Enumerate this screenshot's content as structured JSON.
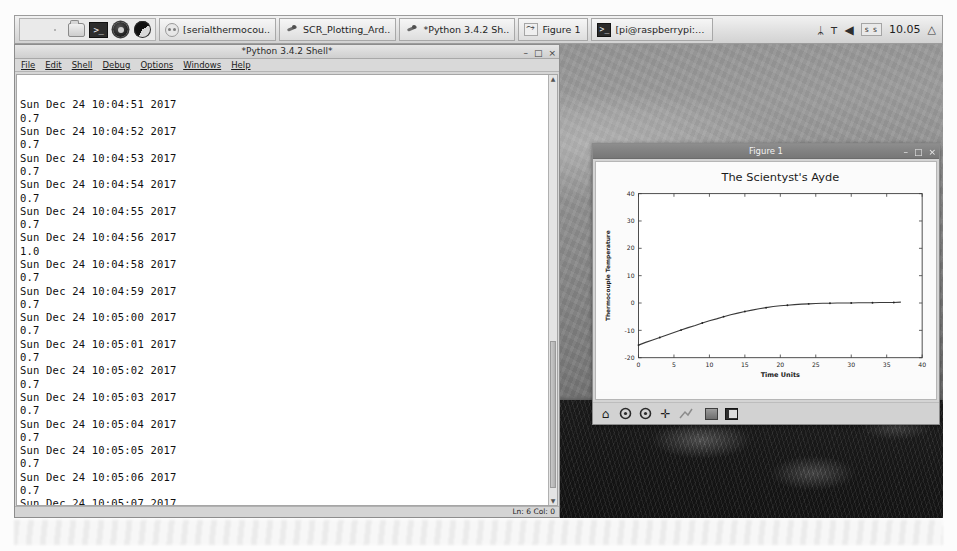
{
  "taskbar": {
    "launchers": [
      {
        "name": "raspberry-menu-icon",
        "label": ""
      },
      {
        "name": "web-browser-icon",
        "label": ""
      },
      {
        "name": "file-manager-icon",
        "label": ""
      },
      {
        "name": "terminal-icon",
        "label": ">_"
      },
      {
        "name": "mathematica-icon",
        "label": ""
      },
      {
        "name": "wolfram-icon",
        "label": ""
      }
    ],
    "windows": [
      {
        "label": "[serialthermocou..",
        "icon": "serial-monitor-icon",
        "active": false
      },
      {
        "label": "SCR_Plotting_Ard..",
        "icon": "python-file-icon",
        "active": false
      },
      {
        "label": "*Python 3.4.2 Sh..",
        "icon": "python-file-icon",
        "active": false
      },
      {
        "label": "Figure 1",
        "icon": "figure-window-icon",
        "active": false
      },
      {
        "label": "[pi@raspberrypi: ~]",
        "icon": "terminal-window-icon",
        "active": false
      }
    ],
    "tray": {
      "bluetooth": "ᛦ",
      "wifi": "ᴛ",
      "volume": "◀",
      "keyboard_layout": "s s",
      "clock": "10.05",
      "eject": "△"
    }
  },
  "idle_window": {
    "title": "*Python 3.4.2 Shell*",
    "menu": [
      "File",
      "Edit",
      "Shell",
      "Debug",
      "Options",
      "Windows",
      "Help"
    ],
    "controls": {
      "minimize": "–",
      "maximize": "□",
      "close": "×"
    },
    "status": "Ln: 6 Col: 0",
    "output": "Sun Dec 24 10:04:51 2017\n0.7\nSun Dec 24 10:04:52 2017\n0.7\nSun Dec 24 10:04:53 2017\n0.7\nSun Dec 24 10:04:54 2017\n0.7\nSun Dec 24 10:04:55 2017\n0.7\nSun Dec 24 10:04:56 2017\n1.0\nSun Dec 24 10:04:58 2017\n0.7\nSun Dec 24 10:04:59 2017\n0.7\nSun Dec 24 10:05:00 2017\n0.7\nSun Dec 24 10:05:01 2017\n0.7\nSun Dec 24 10:05:02 2017\n0.7\nSun Dec 24 10:05:03 2017\n0.7\nSun Dec 24 10:05:04 2017\n0.7\nSun Dec 24 10:05:05 2017\n0.7\nSun Dec 24 10:05:06 2017\n0.7\nSun Dec 24 10:05:07 2017\n0.7\nSun Dec 24 10:05:08 2017\n0.7"
  },
  "figure_window": {
    "title": "Figure 1",
    "controls": {
      "minimize": "–",
      "maximize": "□",
      "close": "×"
    },
    "toolbar": [
      {
        "name": "home-button",
        "glyph": "⌂"
      },
      {
        "name": "back-arrow-button",
        "glyph": "←"
      },
      {
        "name": "forward-arrow-button",
        "glyph": "→"
      },
      {
        "name": "pan-move-button",
        "glyph": "✛"
      },
      {
        "name": "zoom-rect-button",
        "glyph": "⬌"
      },
      {
        "name": "configure-subplots-button",
        "glyph": ""
      },
      {
        "name": "save-figure-button",
        "glyph": ""
      }
    ]
  },
  "chart_data": {
    "type": "line",
    "title": "The Scientyst's Ayde",
    "xlabel": "Time Units",
    "ylabel": "Thermocouple Temperature",
    "xlim": [
      0,
      40
    ],
    "ylim": [
      -20,
      40
    ],
    "xticks": [
      0,
      5,
      10,
      15,
      20,
      25,
      30,
      35,
      40
    ],
    "yticks": [
      -20,
      -10,
      0,
      10,
      20,
      30,
      40
    ],
    "grid": false,
    "legend": "none",
    "line_color": "#3a3a3a",
    "marker_color": "#222222",
    "series": [
      {
        "name": "Thermocouple reading",
        "x": [
          0,
          1,
          2,
          3,
          4,
          5,
          6,
          7,
          8,
          9,
          10,
          11,
          12,
          13,
          14,
          15,
          16,
          17,
          18,
          19,
          20,
          21,
          22,
          23,
          24,
          25,
          26,
          27,
          28,
          29,
          30,
          31,
          32,
          33,
          34,
          35,
          36,
          37
        ],
        "y": [
          -15.4,
          -14.4,
          -13.5,
          -12.6,
          -11.7,
          -10.8,
          -9.9,
          -9.0,
          -8.2,
          -7.3,
          -6.5,
          -5.8,
          -5.0,
          -4.3,
          -3.7,
          -3.1,
          -2.6,
          -2.1,
          -1.7,
          -1.3,
          -1.0,
          -0.8,
          -0.6,
          -0.4,
          -0.3,
          -0.2,
          -0.1,
          -0.1,
          0.0,
          0.0,
          0.0,
          0.1,
          0.1,
          0.1,
          0.2,
          0.2,
          0.2,
          0.3
        ]
      }
    ]
  }
}
